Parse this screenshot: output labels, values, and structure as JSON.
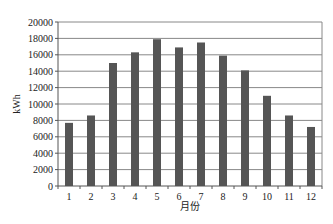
{
  "chart_data": {
    "type": "bar",
    "title": "",
    "xlabel": "月份",
    "ylabel": "kWh",
    "categories": [
      "1",
      "2",
      "3",
      "4",
      "5",
      "6",
      "7",
      "8",
      "9",
      "10",
      "11",
      "12"
    ],
    "values": [
      7700,
      8600,
      15000,
      16300,
      17900,
      16900,
      17500,
      15900,
      14100,
      11000,
      8600,
      7200
    ],
    "ylim": [
      0,
      20000
    ],
    "yticks": [
      0,
      2000,
      4000,
      6000,
      8000,
      10000,
      12000,
      14000,
      16000,
      18000,
      20000
    ],
    "grid": true,
    "legend": null,
    "bar_color": "#555555",
    "grid_color": "#888888"
  }
}
